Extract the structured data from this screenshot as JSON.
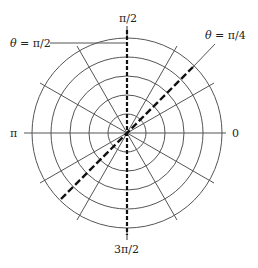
{
  "diagram": {
    "type": "polar-grid",
    "center": {
      "x": 127,
      "y": 133
    },
    "ring_count": 5,
    "ring_spacing_px": 19,
    "radial_line_step_deg": 30,
    "colors": {
      "grid": "#555555",
      "highlight": "#111111",
      "background": "#ffffff"
    },
    "axis_labels": {
      "top": "π/2",
      "bottom": "3π/2",
      "left": "π",
      "right": "0"
    },
    "annotations": [
      {
        "id": "theta-pi-over-2",
        "theta_symbol": "θ",
        "equals": " = ",
        "value": "π/2",
        "line_style": "dashed"
      },
      {
        "id": "theta-pi-over-4",
        "theta_symbol": "θ",
        "equals": " = ",
        "value": "π/4",
        "line_style": "dashed"
      }
    ]
  }
}
